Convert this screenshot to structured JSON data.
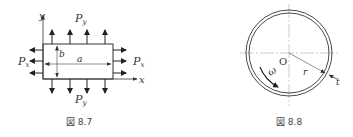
{
  "figures": [
    {
      "id": "fig-8-7",
      "caption": "図 8.7",
      "labels": {
        "y_axis": "y",
        "x_axis": "x",
        "top_load": "P",
        "top_load_sub": "y",
        "bottom_load": "P",
        "bottom_load_sub": "y",
        "left_load": "P",
        "left_load_sub": "x",
        "right_load": "P",
        "right_load_sub": "x",
        "width": "a",
        "height": "b"
      }
    },
    {
      "id": "fig-8-8",
      "caption": "図 8.8",
      "labels": {
        "center": "O",
        "radius": "r",
        "thickness": "t",
        "angular_velocity": "ω"
      }
    }
  ],
  "colors": {
    "stroke": "#333333",
    "guide": "#999999"
  }
}
